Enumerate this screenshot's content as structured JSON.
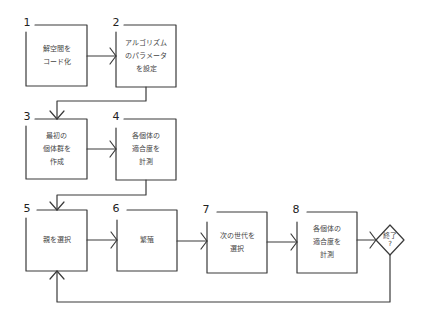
{
  "diagram": {
    "type": "flowchart",
    "title": "",
    "steps": [
      {
        "number": "1",
        "label": "解空間を\nコード化"
      },
      {
        "number": "2",
        "label": "アルゴリズム\nのパラメータ\nを設定"
      },
      {
        "number": "3",
        "label": "最初の\n個体群を\n作成"
      },
      {
        "number": "4",
        "label": "各個体の\n適合度を\n計測"
      },
      {
        "number": "5",
        "label": "親を選択"
      },
      {
        "number": "6",
        "label": "繁殖"
      },
      {
        "number": "7",
        "label": "次の世代を\n選択"
      },
      {
        "number": "8",
        "label": "各個体の\n適合度を\n計測"
      }
    ],
    "decision": {
      "label": "終了\n?"
    },
    "edges": [
      {
        "from": "1",
        "to": "2"
      },
      {
        "from": "2",
        "to": "3"
      },
      {
        "from": "3",
        "to": "4"
      },
      {
        "from": "4",
        "to": "5"
      },
      {
        "from": "5",
        "to": "6"
      },
      {
        "from": "6",
        "to": "7"
      },
      {
        "from": "7",
        "to": "8"
      },
      {
        "from": "8",
        "to": "decision"
      },
      {
        "from": "decision",
        "to": "5"
      }
    ],
    "colors": {
      "stroke": "#3a3a3a",
      "text": "#444444",
      "background": "#ffffff"
    }
  }
}
